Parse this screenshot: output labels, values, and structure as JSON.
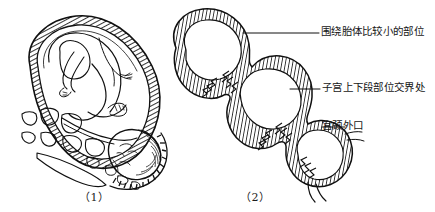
{
  "figure": {
    "panels": [
      {
        "id": "panel-1",
        "caption": "（1）",
        "description": "胎儿在子宫内（纵切面），子宫壁加影线，可见骨盆骨骼及胎头"
      },
      {
        "id": "panel-2",
        "caption": "（2）",
        "description": "病理缩复环／葫芦形子宫，三个膨大部分"
      }
    ],
    "labels": [
      {
        "id": "label-1",
        "text": "围绕胎体比较小的部位"
      },
      {
        "id": "label-2",
        "text": "子宫上下段部位交界处"
      },
      {
        "id": "label-3",
        "text": "宫颈外口"
      }
    ],
    "colors": {
      "ink": "#101010",
      "paper": "#ffffff"
    }
  }
}
